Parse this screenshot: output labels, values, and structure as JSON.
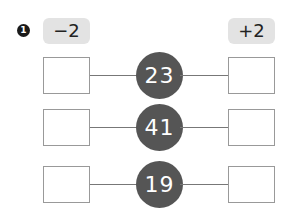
{
  "question": {
    "number": "1"
  },
  "operations": {
    "left": "−2",
    "right": "+2"
  },
  "rows": [
    {
      "value": "23",
      "left_answer": "",
      "right_answer": ""
    },
    {
      "value": "41",
      "left_answer": "",
      "right_answer": ""
    },
    {
      "value": "19",
      "left_answer": "",
      "right_answer": ""
    }
  ],
  "colors": {
    "circle": "#555555",
    "op_badge": "#e3e3e3",
    "box_border": "#999999"
  }
}
